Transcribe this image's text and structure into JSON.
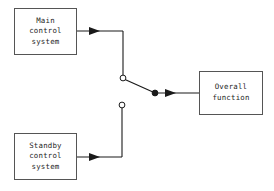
{
  "diagram": {
    "type": "block-diagram",
    "colors": {
      "background": "#ffffff",
      "box_stroke": "#555555",
      "box_fill": "#ffffff",
      "line": "#1a1a1a",
      "text": "#262626"
    },
    "blocks": [
      {
        "id": "main-control-system",
        "lines": [
          "Main",
          "control",
          "system"
        ],
        "line1": "Main",
        "line2": "control",
        "line3": "system",
        "x": 14,
        "y": 8,
        "width": 63,
        "height": 47
      },
      {
        "id": "standby-control-system",
        "lines": [
          "Standby",
          "control",
          "system"
        ],
        "line1": "Standby",
        "line2": "control",
        "line3": "system",
        "x": 14,
        "y": 133,
        "width": 63,
        "height": 47
      },
      {
        "id": "overall-function",
        "lines": [
          "Overall",
          "function"
        ],
        "line1": "Overall",
        "line2": "function",
        "x": 199,
        "y": 71,
        "width": 64,
        "height": 44
      }
    ],
    "switch": {
      "label": "changeover-switch",
      "pole_terminal": {
        "id": "main-contact",
        "state": "open-circle",
        "x": 123,
        "y": 78,
        "radius": 3
      },
      "standby_terminal": {
        "id": "standby-contact",
        "state": "open-circle",
        "x": 122,
        "y": 105,
        "radius": 3
      },
      "common_node": {
        "id": "common-node",
        "state": "filled-circle",
        "x": 155,
        "y": 93,
        "radius": 3
      },
      "connected_from": "main-control-system",
      "connected_to": "overall-function"
    },
    "connections": [
      {
        "id": "main-to-switch",
        "from": "main-control-system",
        "to": "main-contact",
        "arrow": true,
        "arrow_x": 100,
        "arrow_y": 31
      },
      {
        "id": "standby-to-switch",
        "from": "standby-control-system",
        "to": "standby-contact",
        "arrow": true,
        "arrow_x": 100,
        "arrow_y": 157
      },
      {
        "id": "switch-to-overall",
        "from": "common-node",
        "to": "overall-function",
        "arrow": true,
        "arrow_x": 176,
        "arrow_y": 93
      }
    ]
  }
}
